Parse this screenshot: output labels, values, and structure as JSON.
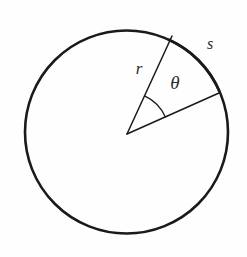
{
  "figure": {
    "background_color": "#fefefe",
    "stroke_color": "#1a1a1a",
    "label_color": "#2b2b2b"
  },
  "labels": {
    "radius": "r",
    "angle": "θ",
    "arc": "s"
  },
  "chart_data": {
    "type": "diagram",
    "shapes": [
      {
        "name": "circle",
        "kind": "circle",
        "cx": 126.5,
        "cy": 132.0,
        "r": 101.5,
        "stroke_width": 2.6,
        "fill": "none"
      },
      {
        "name": "radius-upper",
        "kind": "line",
        "x1": 127.0,
        "y1": 134.0,
        "x2": 172.0,
        "y2": 36.0,
        "stroke_width": 1.5,
        "angle_deg": -65.3
      },
      {
        "name": "radius-lower",
        "kind": "line",
        "x1": 127.0,
        "y1": 134.0,
        "x2": 219.0,
        "y2": 93.0,
        "stroke_width": 1.5,
        "angle_deg": -24.0
      },
      {
        "name": "arc-s",
        "kind": "arc",
        "cx": 126.5,
        "cy": 132.0,
        "r": 101.5,
        "start_angle_deg": -65.3,
        "end_angle_deg": -24.0,
        "stroke_width": 2.6
      },
      {
        "name": "angle-arc",
        "kind": "arc",
        "cx": 127.0,
        "cy": 134.0,
        "r": 42.0,
        "start_angle_deg": -65.3,
        "end_angle_deg": -24.0,
        "stroke_width": 1.3
      }
    ],
    "annotations": [
      {
        "name": "radius-label",
        "text": "r",
        "x": 139.0,
        "y": 70.0,
        "font_size": 17,
        "italic": true
      },
      {
        "name": "angle-label",
        "text": "θ",
        "x": 175.0,
        "y": 85.0,
        "font_size": 19,
        "italic": true
      },
      {
        "name": "arc-label",
        "text": "s",
        "x": 210.0,
        "y": 45.0,
        "font_size": 16,
        "italic": true
      }
    ],
    "measurements": {
      "circle_center": [
        126.5,
        132.0
      ],
      "circle_radius": 101.5,
      "central_angle_deg": 41.3
    }
  }
}
